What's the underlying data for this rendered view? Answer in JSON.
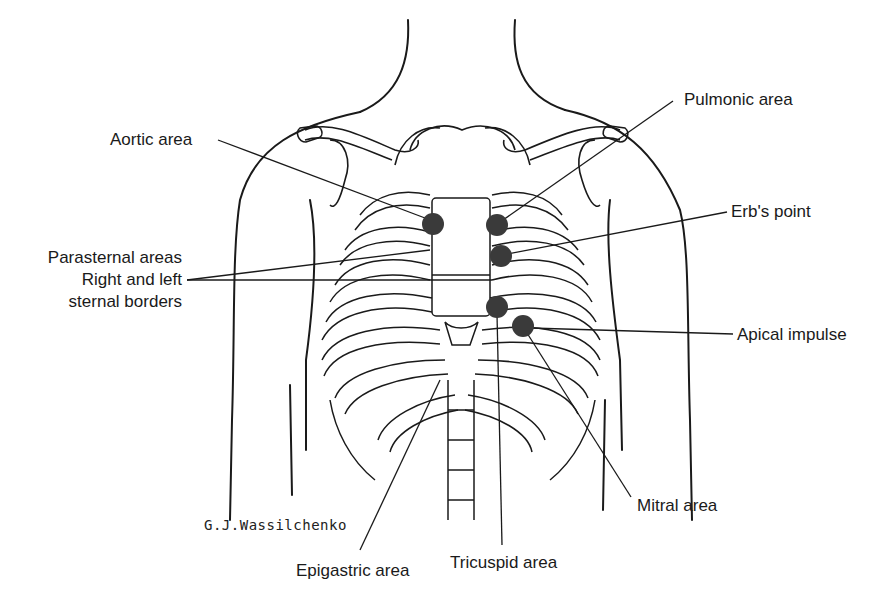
{
  "diagram": {
    "type": "anatomical-illustration",
    "colors": {
      "line": "#1a1a1a",
      "marker": "#3a3a3a",
      "background": "#ffffff"
    },
    "labels": {
      "aortic": "Aortic area",
      "pulmonic": "Pulmonic area",
      "erbs": "Erb's point",
      "parasternal_1": "Parasternal areas",
      "parasternal_2": "Right and left",
      "parasternal_3": "sternal borders",
      "apical": "Apical impulse",
      "mitral": "Mitral area",
      "tricuspid": "Tricuspid area",
      "epigastric": "Epigastric area"
    },
    "signature": "G.J.Wassilchenko",
    "markers": [
      {
        "name": "aortic",
        "x": 433,
        "y": 224
      },
      {
        "name": "pulmonic",
        "x": 497,
        "y": 225
      },
      {
        "name": "erbs",
        "x": 501,
        "y": 256
      },
      {
        "name": "tricuspid",
        "x": 497,
        "y": 307
      },
      {
        "name": "mitral",
        "x": 523,
        "y": 326
      }
    ]
  }
}
